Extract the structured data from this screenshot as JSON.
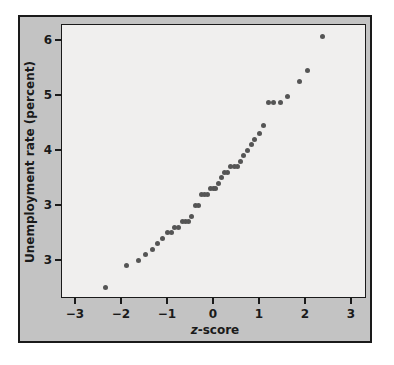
{
  "chart_data": {
    "type": "scatter",
    "title": "",
    "xlabel": "z-score",
    "ylabel": "Unemployment rate (percent)",
    "xlim": [
      -3.3,
      3.3
    ],
    "ylim": [
      1.5,
      6.3
    ],
    "x_ticks": [
      {
        "value": -3,
        "label": "−3"
      },
      {
        "value": -2,
        "label": "−2"
      },
      {
        "value": -1,
        "label": "−1"
      },
      {
        "value": 0,
        "label": "0"
      },
      {
        "value": 1,
        "label": "1"
      },
      {
        "value": 2,
        "label": "2"
      },
      {
        "value": 3,
        "label": "3"
      }
    ],
    "y_ticks": [
      {
        "value": 6,
        "label": "6"
      },
      {
        "value": 5,
        "label": "5"
      },
      {
        "value": 4,
        "label": "4"
      },
      {
        "value": 3,
        "label": "3"
      },
      {
        "value": 2,
        "label": "3"
      }
    ],
    "grid": false,
    "legend": null,
    "point_color": "#555555",
    "plot_background": "#f0efee",
    "frame_background": "#c3c3c3",
    "points": [
      {
        "x": -2.33,
        "y": 1.5
      },
      {
        "x": -1.87,
        "y": 1.9
      },
      {
        "x": -1.63,
        "y": 2.0
      },
      {
        "x": -1.46,
        "y": 2.1
      },
      {
        "x": -1.32,
        "y": 2.2
      },
      {
        "x": -1.2,
        "y": 2.3
      },
      {
        "x": -1.1,
        "y": 2.4
      },
      {
        "x": -1.0,
        "y": 2.5
      },
      {
        "x": -0.91,
        "y": 2.5
      },
      {
        "x": -0.83,
        "y": 2.6
      },
      {
        "x": -0.75,
        "y": 2.6
      },
      {
        "x": -0.67,
        "y": 2.7
      },
      {
        "x": -0.6,
        "y": 2.7
      },
      {
        "x": -0.53,
        "y": 2.7
      },
      {
        "x": -0.46,
        "y": 2.8
      },
      {
        "x": -0.39,
        "y": 3.0
      },
      {
        "x": -0.32,
        "y": 3.0
      },
      {
        "x": -0.26,
        "y": 3.2
      },
      {
        "x": -0.19,
        "y": 3.2
      },
      {
        "x": -0.13,
        "y": 3.2
      },
      {
        "x": -0.06,
        "y": 3.3
      },
      {
        "x": 0.0,
        "y": 3.3
      },
      {
        "x": 0.06,
        "y": 3.3
      },
      {
        "x": 0.13,
        "y": 3.4
      },
      {
        "x": 0.19,
        "y": 3.5
      },
      {
        "x": 0.26,
        "y": 3.6
      },
      {
        "x": 0.32,
        "y": 3.6
      },
      {
        "x": 0.39,
        "y": 3.7
      },
      {
        "x": 0.46,
        "y": 3.7
      },
      {
        "x": 0.53,
        "y": 3.7
      },
      {
        "x": 0.6,
        "y": 3.8
      },
      {
        "x": 0.67,
        "y": 3.9
      },
      {
        "x": 0.75,
        "y": 4.0
      },
      {
        "x": 0.83,
        "y": 4.1
      },
      {
        "x": 0.91,
        "y": 4.2
      },
      {
        "x": 1.0,
        "y": 4.3
      },
      {
        "x": 1.1,
        "y": 4.45
      },
      {
        "x": 1.2,
        "y": 4.87
      },
      {
        "x": 1.32,
        "y": 4.87
      },
      {
        "x": 1.46,
        "y": 4.87
      },
      {
        "x": 1.63,
        "y": 4.97
      },
      {
        "x": 1.87,
        "y": 5.25
      },
      {
        "x": 2.05,
        "y": 5.45
      },
      {
        "x": 2.37,
        "y": 6.07
      }
    ]
  },
  "axes": {
    "xtitle_italic": "z",
    "xtitle_rest": "-score",
    "ytitle": "Unemployment rate (percent)"
  },
  "caption": "FIGURE"
}
